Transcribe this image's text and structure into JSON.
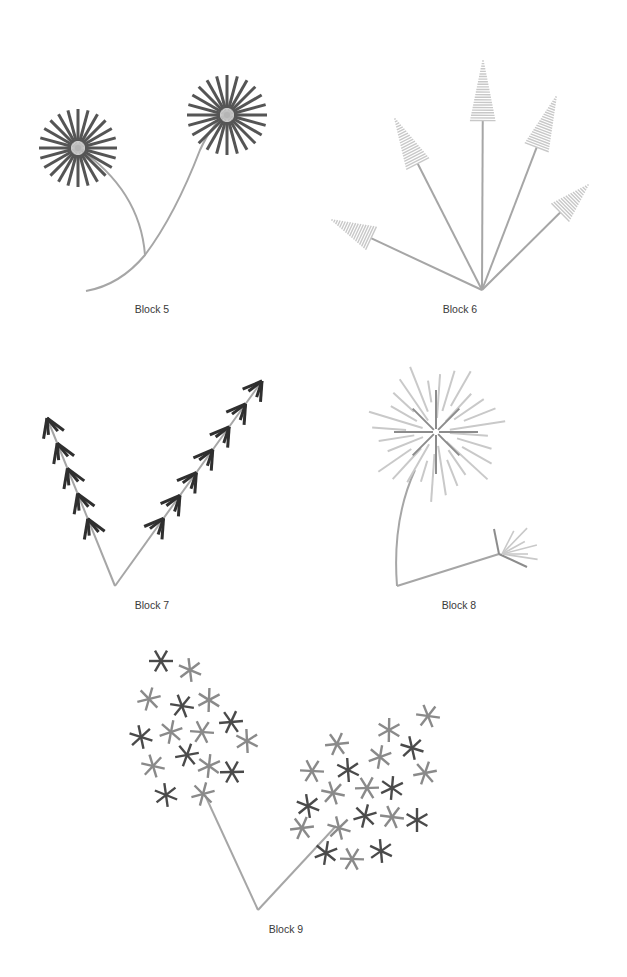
{
  "page": {
    "background": "#ffffff",
    "label_color": "#3a3a3a",
    "stem_color": "#a6a6a6"
  },
  "blocks": [
    {
      "id": "block5",
      "label": "Block 5",
      "label_pos": [
        152,
        305
      ],
      "description": "Two dandelion-like flowers with dark radial rays on curved stems",
      "ray_color": "#555555",
      "stems": [
        "M 86 291 Q 120 285 145 255 Q 140 190 78 148",
        "M 145 255 Q 175 215 200 150 Q 213 122 227 115"
      ],
      "heads": [
        {
          "cx": 78,
          "cy": 148,
          "rays": 24,
          "r_in": 7,
          "r_out": 39
        },
        {
          "cx": 227,
          "cy": 115,
          "rays": 24,
          "r_in": 7,
          "r_out": 40
        }
      ]
    },
    {
      "id": "block6",
      "label": "Block 6",
      "label_pos": [
        460,
        305
      ],
      "description": "Five stems fanning out from a point, each tipped with a striped light-gray cone",
      "cone_color": "#c8c8c8",
      "origin": [
        482,
        290
      ],
      "tips": [
        [
          332,
          220
        ],
        [
          395,
          119
        ],
        [
          483,
          61
        ],
        [
          556,
          97
        ],
        [
          588,
          185
        ]
      ],
      "cone_base_frac": 0.74
    },
    {
      "id": "block7",
      "label": "Block 7",
      "label_pos": [
        152,
        601
      ],
      "description": "V-shaped stems with dark chevron / arrow feather marks along each arm",
      "mark_color": "#2f2f2f",
      "origin": [
        115,
        586
      ],
      "arms": [
        {
          "tip": [
            47,
            418
          ],
          "marks": 5
        },
        {
          "tip": [
            262,
            381
          ],
          "marks": 7
        }
      ]
    },
    {
      "id": "block8",
      "label": "Block 8",
      "label_pos": [
        459,
        601
      ],
      "description": "Large light-gray starburst on a curved stem with a small fan-shaped seedhead on a side branch",
      "burst_dark": "#8c8c8c",
      "burst_light": "#c9c9c9",
      "burst_center": [
        436,
        432
      ],
      "small_center": [
        499,
        554
      ],
      "stems": [
        "M 415 470 Q 392 520 397 586",
        "M 397 586 L 499 554"
      ]
    },
    {
      "id": "block9",
      "label": "Block 9",
      "label_pos": [
        286,
        925
      ],
      "description": "V-shaped stems ending in clusters of six-pointed asterisk-like florets in mixed grays",
      "origin": [
        258,
        910
      ],
      "stems": [
        "M 258 910 L 205 795",
        "M 258 910 L 336 826"
      ],
      "florets": [
        [
          161,
          661,
          "d"
        ],
        [
          190,
          670,
          "m"
        ],
        [
          149,
          699,
          "m"
        ],
        [
          182,
          706,
          "d"
        ],
        [
          209,
          700,
          "m"
        ],
        [
          231,
          722,
          "d"
        ],
        [
          141,
          737,
          "d"
        ],
        [
          171,
          732,
          "m"
        ],
        [
          202,
          732,
          "m"
        ],
        [
          247,
          741,
          "m"
        ],
        [
          187,
          755,
          "d"
        ],
        [
          153,
          766,
          "m"
        ],
        [
          209,
          766,
          "m"
        ],
        [
          232,
          772,
          "d"
        ],
        [
          166,
          795,
          "d"
        ],
        [
          203,
          794,
          "m"
        ],
        [
          428,
          716,
          "m"
        ],
        [
          389,
          730,
          "m"
        ],
        [
          337,
          744,
          "m"
        ],
        [
          412,
          748,
          "d"
        ],
        [
          380,
          757,
          "m"
        ],
        [
          312,
          771,
          "m"
        ],
        [
          348,
          770,
          "d"
        ],
        [
          425,
          773,
          "m"
        ],
        [
          333,
          793,
          "m"
        ],
        [
          392,
          788,
          "d"
        ],
        [
          367,
          788,
          "m"
        ],
        [
          308,
          806,
          "d"
        ],
        [
          365,
          816,
          "d"
        ],
        [
          392,
          817,
          "m"
        ],
        [
          417,
          820,
          "d"
        ],
        [
          302,
          828,
          "m"
        ],
        [
          339,
          828,
          "m"
        ],
        [
          326,
          853,
          "d"
        ],
        [
          352,
          859,
          "m"
        ],
        [
          381,
          851,
          "d"
        ]
      ],
      "floret_colors": {
        "d": "#4a4a4a",
        "m": "#8a8a8a"
      }
    }
  ]
}
